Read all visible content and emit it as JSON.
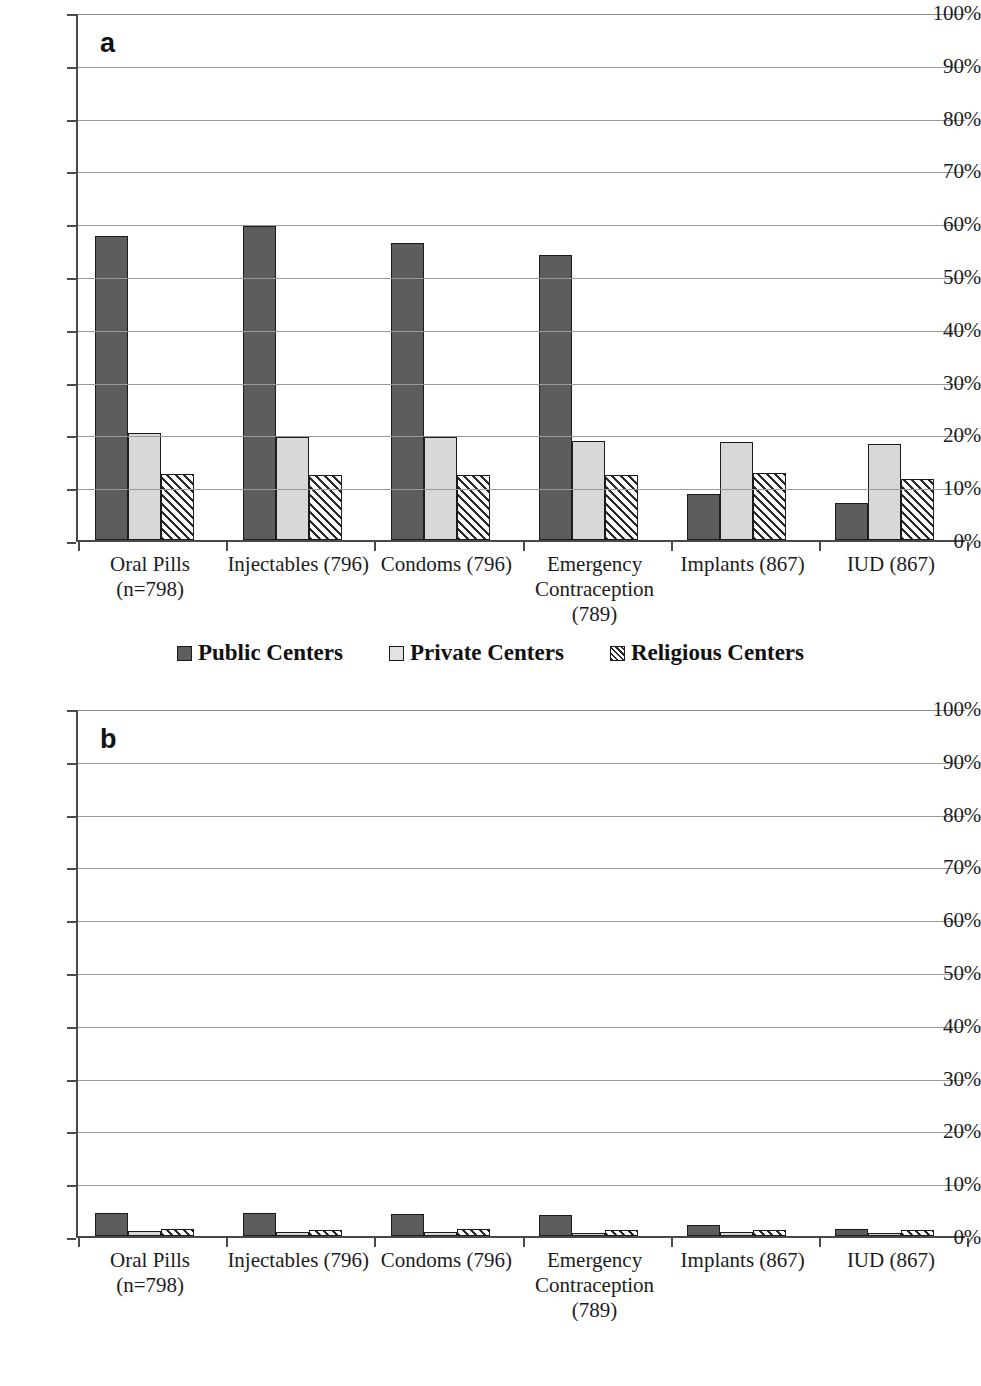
{
  "chart_data": [
    {
      "type": "bar",
      "panel_label": "a",
      "title": "",
      "xlabel": "",
      "ylabel": "",
      "ylim": [
        0,
        100
      ],
      "ytick_labels": [
        "100%",
        "90%",
        "80%",
        "70%",
        "60%",
        "50%",
        "40%",
        "30%",
        "20%",
        "10%",
        "0%"
      ],
      "ytick_values": [
        100,
        90,
        80,
        70,
        60,
        50,
        40,
        30,
        20,
        10,
        0
      ],
      "grid": true,
      "legend_position": "bottom",
      "categories": [
        "Oral Pills (n=798)",
        "Injectables (796)",
        "Condoms (796)",
        "Emergency Contraception (789)",
        "Implants (867)",
        "IUD (867)"
      ],
      "category_lines": [
        [
          "Oral Pills",
          "(n=798)"
        ],
        [
          "Injectables (796)"
        ],
        [
          "Condoms (796)"
        ],
        [
          "Emergency",
          "Contraception",
          "(789)"
        ],
        [
          "Implants (867)"
        ],
        [
          "IUD (867)"
        ]
      ],
      "series": [
        {
          "name": "Public Centers",
          "values": [
            57.5,
            59.5,
            56.3,
            54.0,
            8.8,
            7.0
          ]
        },
        {
          "name": "Private Centers",
          "values": [
            20.3,
            19.5,
            19.5,
            18.7,
            18.5,
            18.2
          ]
        },
        {
          "name": "Religious Centers",
          "values": [
            12.5,
            12.3,
            12.3,
            12.3,
            12.7,
            11.6
          ]
        }
      ]
    },
    {
      "type": "bar",
      "panel_label": "b",
      "title": "",
      "xlabel": "",
      "ylabel": "",
      "ylim": [
        0,
        100
      ],
      "ytick_labels": [
        "100%",
        "90%",
        "80%",
        "70%",
        "60%",
        "50%",
        "40%",
        "30%",
        "20%",
        "10%",
        "0%"
      ],
      "ytick_values": [
        100,
        90,
        80,
        70,
        60,
        50,
        40,
        30,
        20,
        10,
        0
      ],
      "grid": true,
      "legend_position": "bottom",
      "categories": [
        "Oral Pills (n=798)",
        "Injectables (796)",
        "Condoms (796)",
        "Emergency Contraception (789)",
        "Implants (867)",
        "IUD (867)"
      ],
      "category_lines": [
        [
          "Oral Pills",
          "(n=798)"
        ],
        [
          "Injectables (796)"
        ],
        [
          "Condoms (796)"
        ],
        [
          "Emergency",
          "Contraception",
          "(789)"
        ],
        [
          "Implants (867)"
        ],
        [
          "IUD (867)"
        ]
      ],
      "series": [
        {
          "name": "Public Hospitals",
          "values": [
            4.3,
            4.3,
            4.2,
            4.0,
            2.1,
            1.3
          ]
        },
        {
          "name": "Private Hospitals",
          "values": [
            1.0,
            0.8,
            0.7,
            0.6,
            0.7,
            0.3
          ]
        },
        {
          "name": "Religious Hospitals",
          "values": [
            1.4,
            1.1,
            1.3,
            1.2,
            1.2,
            1.1
          ]
        }
      ]
    }
  ],
  "colors": {
    "series_public": "#5d5d5d",
    "series_private": "#d8d8d8",
    "series_religious": "#ffffff",
    "axis": "#4a4a4a",
    "gridline": "#9a9a9a",
    "bar_outline": "#1b1b1b",
    "text": "#1c1c1c"
  }
}
